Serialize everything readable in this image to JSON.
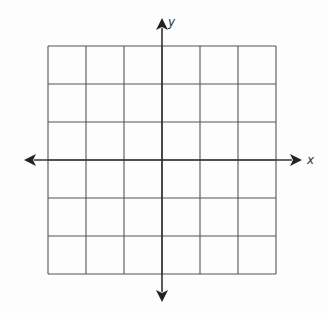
{
  "diagram": {
    "type": "coordinate-grid",
    "columns": 6,
    "rows": 6,
    "x_axis_label": "x",
    "y_axis_label": "y",
    "axes_arrows": "both-ends",
    "colors": {
      "grid": "#555555",
      "axes": "#333333",
      "background": "#fdfdfd"
    }
  }
}
